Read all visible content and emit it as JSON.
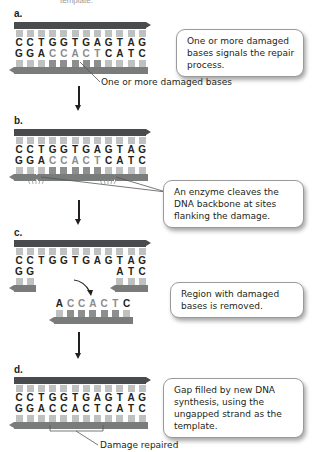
{
  "header_fragment": "template.",
  "panels": {
    "a": {
      "label": "a.",
      "top_sequence": [
        "C",
        "C",
        "T",
        "G",
        "G",
        "T",
        "G",
        "A",
        "G",
        "T",
        "A",
        "G"
      ],
      "bottom_sequence": [
        "G",
        "G",
        "A",
        "C",
        "C",
        "A",
        "C",
        "T",
        "C",
        "A",
        "T",
        "C"
      ],
      "damaged_bottom_indices": [
        3,
        4,
        5,
        6,
        7
      ],
      "callout": "One or more damaged bases signals the repair process.",
      "pointer_label": "One or more damaged bases"
    },
    "b": {
      "label": "b.",
      "top_sequence": [
        "C",
        "C",
        "T",
        "G",
        "G",
        "T",
        "G",
        "A",
        "G",
        "T",
        "A",
        "G"
      ],
      "bottom_sequence": [
        "G",
        "G",
        "A",
        "C",
        "C",
        "A",
        "C",
        "T",
        "C",
        "A",
        "T",
        "C"
      ],
      "damaged_bottom_indices": [
        3,
        4,
        5,
        6,
        7
      ],
      "callout": "An enzyme cleaves the DNA backbone at sites flanking the damage."
    },
    "c": {
      "label": "c.",
      "top_sequence": [
        "C",
        "C",
        "T",
        "G",
        "G",
        "T",
        "G",
        "A",
        "G",
        "T",
        "A",
        "G"
      ],
      "bottom_left": [
        "G",
        "G"
      ],
      "bottom_right": [
        "A",
        "T",
        "C"
      ],
      "excised_fragment": [
        "A",
        "C",
        "C",
        "A",
        "C",
        "T",
        "C"
      ],
      "excised_damaged_indices": [
        1,
        2,
        3,
        4,
        5
      ],
      "callout": "Region with damaged bases is removed."
    },
    "d": {
      "label": "d.",
      "top_sequence": [
        "C",
        "C",
        "T",
        "G",
        "G",
        "T",
        "G",
        "A",
        "G",
        "T",
        "A",
        "G"
      ],
      "bottom_sequence": [
        "G",
        "G",
        "A",
        "C",
        "C",
        "A",
        "C",
        "T",
        "C",
        "A",
        "T",
        "C"
      ],
      "callout": "Gap filled by new DNA synthesis, using the ungapped strand as the template.",
      "bracket_label": "Damage repaired"
    }
  },
  "colors": {
    "backbone_top": "#4a4b4c",
    "backbone_bottom": "#7a7b7b",
    "base_tab": "#bfc1c1",
    "damaged_base": "#8a8c8c",
    "text": "#231f20"
  }
}
